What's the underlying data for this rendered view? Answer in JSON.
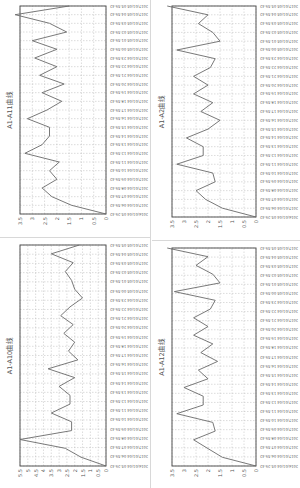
{
  "chart_data": [
    {
      "id": "a1_a11",
      "type": "line",
      "title": "A1-A11曲线",
      "xlabel": "",
      "ylabel": "",
      "ylim": [
        0,
        3.5
      ],
      "yticks": [
        "0",
        "0.5",
        "1",
        "1.5",
        "2",
        "2.5",
        "3",
        "3.5"
      ],
      "grid": true,
      "legend": null,
      "categories": [
        "2016/01/04 05:29:42",
        "2017/01/04 06:59:42",
        "2017/01/04 07:59:42",
        "2017/01/04 08:59:42",
        "2017/01/04 09:59:42",
        "2017/01/04 10:59:42",
        "2017/01/04 11:59:42",
        "2017/01/04 12:59:42",
        "2017/01/04 13:59:42",
        "2017/01/04 14:59:42",
        "2017/01/04 15:59:42",
        "2017/01/04 16:59:42",
        "2017/01/04 17:59:42",
        "2017/01/04 18:59:42",
        "2017/01/04 19:59:42",
        "2017/01/04 20:59:42",
        "2017/01/04 21:59:42",
        "2017/01/04 22:59:42",
        "2017/01/04 23:59:42",
        "2017/01/05 00:59:42",
        "2017/01/05 01:59:42",
        "2017/01/05 02:59:42",
        "2017/01/05 03:59:42",
        "2017/01/05 04:59:42",
        "2017/01/05 05:59:42"
      ],
      "values": [
        0,
        1.4,
        2.2,
        2.6,
        2.0,
        2.3,
        1.9,
        3.3,
        2.6,
        2.3,
        2.3,
        3.2,
        2.4,
        1.8,
        2.6,
        1.7,
        2.7,
        2.0,
        2.9,
        2.0,
        3.0,
        1.6,
        2.3,
        3.8,
        1.5
      ]
    },
    {
      "id": "a1_a2",
      "type": "line",
      "title": "A1-A2曲线",
      "xlabel": "",
      "ylabel": "",
      "ylim": [
        0,
        3.5
      ],
      "yticks": [
        "0",
        "0.5",
        "1",
        "1.5",
        "2",
        "2.5",
        "3",
        "3.5"
      ],
      "grid": true,
      "legend": null,
      "categories": [
        "2016/01/04 05:29:42",
        "2017/01/04 06:59:42",
        "2017/01/04 07:59:42",
        "2017/01/04 08:59:42",
        "2017/01/04 09:59:42",
        "2017/01/04 10:59:42",
        "2017/01/04 11:59:42",
        "2017/01/04 12:59:42",
        "2017/01/04 13:59:42",
        "2017/01/04 14:59:42",
        "2017/01/04 15:59:42",
        "2017/01/04 16:59:42",
        "2017/01/04 17:59:42",
        "2017/01/04 18:59:42",
        "2017/01/04 19:59:42",
        "2017/01/04 20:59:42",
        "2017/01/04 21:59:42",
        "2017/01/04 22:59:42",
        "2017/01/04 23:59:42",
        "2017/01/05 00:59:42",
        "2017/01/05 01:59:42",
        "2017/01/05 02:59:42",
        "2017/01/05 03:59:42",
        "2017/01/05 04:59:42",
        "2017/01/05 05:59:42"
      ],
      "values": [
        0,
        1.4,
        2.1,
        2.5,
        1.7,
        1.8,
        3.3,
        2.2,
        2.2,
        2.9,
        2.0,
        1.5,
        2.3,
        1.8,
        2.6,
        2.0,
        2.6,
        1.9,
        1.7,
        3.3,
        1.5,
        1.8,
        2.4,
        2.0,
        3.7
      ]
    },
    {
      "id": "a1_a10",
      "type": "line",
      "title": "A1-A10曲线",
      "xlabel": "",
      "ylabel": "",
      "ylim": [
        0,
        5.5
      ],
      "yticks": [
        "0",
        "0.5",
        "1",
        "1.5",
        "2",
        "2.5",
        "3",
        "3.5",
        "4",
        "4.5",
        "5",
        "5.5"
      ],
      "grid": true,
      "legend": null,
      "categories": [
        "2016/01/04 05:29:42",
        "2017/01/04 06:59:42",
        "2017/01/04 07:59:42",
        "2017/01/04 08:59:42",
        "2017/01/04 09:59:42",
        "2017/01/04 10:59:42",
        "2017/01/04 11:59:42",
        "2017/01/04 12:59:42",
        "2017/01/04 13:59:42",
        "2017/01/04 14:59:42",
        "2017/01/04 15:59:42",
        "2017/01/04 16:59:42",
        "2017/01/04 17:59:42",
        "2017/01/04 18:59:42",
        "2017/01/04 19:59:42",
        "2017/01/04 20:59:42",
        "2017/01/04 21:59:42",
        "2017/01/04 22:59:42",
        "2017/01/04 23:59:42",
        "2017/01/05 00:59:42",
        "2017/01/05 01:59:42",
        "2017/01/05 02:59:42",
        "2017/01/05 03:59:42",
        "2017/01/05 04:59:42",
        "2017/01/05 05:59:42"
      ],
      "values": [
        0,
        1.6,
        2.6,
        5.5,
        2.2,
        2.2,
        3.5,
        2.3,
        2.3,
        3.0,
        2.0,
        3.7,
        1.8,
        2.4,
        2.0,
        2.7,
        2.1,
        2.9,
        2.3,
        1.5,
        2.0,
        2.2,
        2.6,
        2.1,
        3.5,
        1.7
      ]
    },
    {
      "id": "a1_a12",
      "type": "line",
      "title": "A1-A12曲线",
      "xlabel": "",
      "ylabel": "",
      "ylim": [
        0,
        3.5
      ],
      "yticks": [
        "0",
        "0.5",
        "1",
        "1.5",
        "2",
        "2.5",
        "3",
        "3.5"
      ],
      "grid": true,
      "legend": null,
      "categories": [
        "2016/01/04 05:29:42",
        "2017/01/04 06:59:42",
        "2017/01/04 07:59:42",
        "2017/01/04 08:59:42",
        "2017/01/04 09:59:42",
        "2017/01/04 10:59:42",
        "2017/01/04 11:59:42",
        "2017/01/04 12:59:42",
        "2017/01/04 13:59:42",
        "2017/01/04 14:59:42",
        "2017/01/04 15:59:42",
        "2017/01/04 16:59:42",
        "2017/01/04 17:59:42",
        "2017/01/04 18:59:42",
        "2017/01/04 19:59:42",
        "2017/01/04 20:59:42",
        "2017/01/04 21:59:42",
        "2017/01/04 22:59:42",
        "2017/01/04 23:59:42",
        "2017/01/05 00:59:42",
        "2017/01/05 01:59:42",
        "2017/01/05 02:59:42",
        "2017/01/05 03:59:42",
        "2017/01/05 04:59:42",
        "2017/01/05 05:59:42"
      ],
      "values": [
        0,
        1.4,
        2.0,
        2.6,
        1.7,
        1.8,
        3.3,
        2.2,
        2.2,
        3.0,
        2.0,
        2.4,
        1.6,
        2.3,
        1.8,
        2.6,
        2.0,
        2.6,
        1.9,
        1.7,
        3.4,
        1.5,
        1.8,
        2.5,
        2.0,
        3.8
      ]
    }
  ],
  "style": {
    "line_color": "#6a6a6a",
    "grid_color": "#b8b8b8",
    "frame_color": "#555555",
    "divider_color": "#d8d8d8"
  }
}
